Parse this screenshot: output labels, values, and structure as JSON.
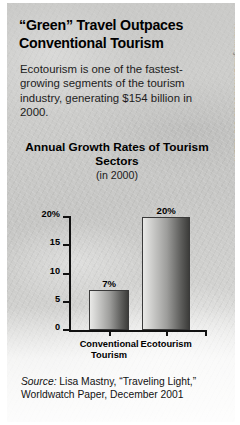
{
  "article": {
    "headline": "“Green” Travel Outpaces Conventional Tourism",
    "deck": "Ecotourism is one of the fastest-growing segments of the tourism industry, generating $154 billion in 2000.",
    "source_prefix": "Source:",
    "source_text": " Lisa Mastny, “Traveling Light,” Worldwatch Paper, December 2001",
    "photo_credit": "Terra Incognita Ecotours/Gerard “Ged” Caddick"
  },
  "chart_data": {
    "type": "bar",
    "title": "Annual Growth Rates of Tourism Sectors",
    "subtitle": "(in 2000)",
    "categories": [
      "Conventional Tourism",
      "Ecotourism"
    ],
    "category_lines": [
      [
        "Conventional",
        "Tourism"
      ],
      [
        "Ecotourism"
      ]
    ],
    "values": [
      7,
      20
    ],
    "value_labels": [
      "7%",
      "20%"
    ],
    "xlabel": "",
    "ylabel": "",
    "ylim": [
      0,
      20
    ],
    "yticks": [
      20,
      15,
      10,
      5,
      0
    ],
    "ytick_labels": [
      "20%",
      "15",
      "10",
      "5",
      "0"
    ],
    "grid": false,
    "legend": false
  },
  "colors": {
    "background": "#cdcdcb",
    "text": "#000000",
    "bar_light": "#e9e9e7",
    "bar_dark": "#3c3c3a",
    "axis": "#111111",
    "credit": "#6e6e6c"
  }
}
